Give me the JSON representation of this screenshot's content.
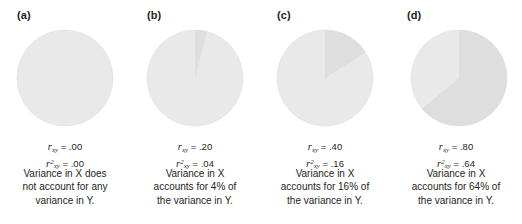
{
  "figure": {
    "background_color": "#ffffff",
    "text_color": "#231f20",
    "circle_base_color": "#e9e9e9",
    "slice_color": "#dedede",
    "circle_outline_color": "#e3e3e3"
  },
  "chart_data": {
    "type": "pie",
    "note": "Four pie charts; shaded slice = proportion of variance in Y accounted for by X (r-squared). Slice starts at 12 o'clock and sweeps clockwise.",
    "panels": [
      {
        "panel_label": "(a)",
        "r_value": ".00",
        "r_squared_value": ".00",
        "shared_variance_percent": 0,
        "slice_degrees": 0,
        "slice_start_degrees": 0,
        "categories": [
          "Variance in Y accounted for by X",
          "Unexplained variance in Y"
        ],
        "values": [
          0,
          100
        ],
        "caption_lines": [
          "Variance in X does",
          "not account for any",
          "variance in Y."
        ]
      },
      {
        "panel_label": "(b)",
        "r_value": ".20",
        "r_squared_value": ".04",
        "shared_variance_percent": 4,
        "slice_degrees": 14.4,
        "slice_start_degrees": 0,
        "categories": [
          "Variance in Y accounted for by X",
          "Unexplained variance in Y"
        ],
        "values": [
          4,
          96
        ],
        "caption_lines": [
          "Variance in X",
          "accounts for 4% of",
          "the variance in Y."
        ]
      },
      {
        "panel_label": "(c)",
        "r_value": ".40",
        "r_squared_value": ".16",
        "shared_variance_percent": 16,
        "slice_degrees": 57.6,
        "slice_start_degrees": 0,
        "categories": [
          "Variance in Y accounted for by X",
          "Unexplained variance in Y"
        ],
        "values": [
          16,
          84
        ],
        "caption_lines": [
          "Variance in X",
          "accounts for 16% of",
          "the variance in Y."
        ]
      },
      {
        "panel_label": "(d)",
        "r_value": ".80",
        "r_squared_value": ".64",
        "shared_variance_percent": 64,
        "slice_degrees": 230.4,
        "slice_start_degrees": 0,
        "categories": [
          "Variance in Y accounted for by X",
          "Unexplained variance in Y"
        ],
        "values": [
          64,
          36
        ],
        "caption_lines": [
          "Variance in X",
          "accounts for 64% of",
          "the variance in Y."
        ]
      }
    ],
    "symbols": {
      "r_symbol": "r",
      "r_subscript": "xy",
      "r_squared_superscript": "2",
      "equals": "="
    }
  }
}
